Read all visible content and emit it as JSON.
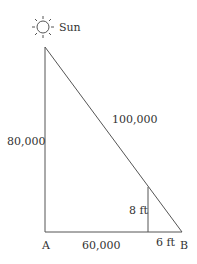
{
  "sun_label": "Sun",
  "labels": {
    "vertical_side": "80,000",
    "hypotenuse": "100,000",
    "base": "60,000",
    "small_height": "8 ft",
    "small_base": "6 ft",
    "point_a": "A",
    "point_b": "B"
  }
}
